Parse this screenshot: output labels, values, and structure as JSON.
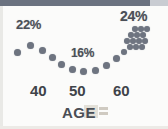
{
  "figure": {
    "top_bar_color": "#6b7280",
    "dot_color": "#6e7480",
    "text_color": "#4b4f57",
    "background_color": "#fbfbfa"
  },
  "axis": {
    "title": "AGE",
    "ticks": [
      {
        "label": "40",
        "x": 38
      },
      {
        "label": "50",
        "x": 77
      },
      {
        "label": "60",
        "x": 121
      }
    ]
  },
  "annotations": [
    {
      "name": "left-peak-label",
      "text": "22%"
    },
    {
      "name": "right-peak-label",
      "text": "24%"
    },
    {
      "name": "trough-label",
      "text": "16%"
    }
  ],
  "chart_data": {
    "type": "scatter",
    "title": "",
    "subtitle": "",
    "xlabel": "AGE",
    "ylabel": "",
    "xlim": [
      34,
      66
    ],
    "ylim": [
      14,
      26
    ],
    "grid": false,
    "legend": null,
    "tick_labels_x": [
      "40",
      "50",
      "60"
    ],
    "annotations": [
      "22%",
      "24%",
      "16%"
    ],
    "series": [
      {
        "name": "percent-by-age",
        "points": [
          {
            "x": 36.0,
            "y": 21.0
          },
          {
            "x": 38.5,
            "y": 21.6
          },
          {
            "x": 41.0,
            "y": 20.6
          },
          {
            "x": 43.5,
            "y": 19.6
          },
          {
            "x": 46.0,
            "y": 18.4
          },
          {
            "x": 48.0,
            "y": 17.2
          },
          {
            "x": 50.0,
            "y": 16.6
          },
          {
            "x": 52.0,
            "y": 16.4
          },
          {
            "x": 54.0,
            "y": 16.8
          },
          {
            "x": 56.0,
            "y": 17.8
          },
          {
            "x": 58.0,
            "y": 19.2
          },
          {
            "x": 59.5,
            "y": 20.4
          },
          {
            "x": 60.5,
            "y": 21.4
          },
          {
            "x": 61.5,
            "y": 22.2
          },
          {
            "x": 62.0,
            "y": 22.8
          },
          {
            "x": 62.5,
            "y": 23.4
          },
          {
            "x": 63.0,
            "y": 24.0
          },
          {
            "x": 63.5,
            "y": 24.4
          },
          {
            "x": 64.0,
            "y": 24.8
          }
        ]
      }
    ]
  },
  "dots": {
    "curve": [
      {
        "x": 17,
        "y": 46,
        "d": 7
      },
      {
        "x": 30,
        "y": 39,
        "d": 7
      },
      {
        "x": 42,
        "y": 44,
        "d": 7
      },
      {
        "x": 52,
        "y": 51,
        "d": 7
      },
      {
        "x": 61,
        "y": 58,
        "d": 7
      },
      {
        "x": 72,
        "y": 63,
        "d": 7
      },
      {
        "x": 83,
        "y": 65,
        "d": 7
      },
      {
        "x": 95,
        "y": 64,
        "d": 7
      },
      {
        "x": 106,
        "y": 59,
        "d": 7
      },
      {
        "x": 116,
        "y": 52,
        "d": 7
      }
    ],
    "cluster": [
      {
        "x": 124,
        "y": 46,
        "d": 6
      },
      {
        "x": 130,
        "y": 41,
        "d": 6
      },
      {
        "x": 136,
        "y": 41,
        "d": 6
      },
      {
        "x": 142,
        "y": 41,
        "d": 6
      },
      {
        "x": 127,
        "y": 35,
        "d": 6
      },
      {
        "x": 133,
        "y": 35,
        "d": 6
      },
      {
        "x": 139,
        "y": 35,
        "d": 6
      },
      {
        "x": 145,
        "y": 35,
        "d": 6
      },
      {
        "x": 131,
        "y": 29,
        "d": 6
      },
      {
        "x": 137,
        "y": 29,
        "d": 6
      },
      {
        "x": 143,
        "y": 29,
        "d": 6
      },
      {
        "x": 135,
        "y": 23,
        "d": 6
      },
      {
        "x": 141,
        "y": 23,
        "d": 6
      },
      {
        "x": 147,
        "y": 23,
        "d": 6
      }
    ]
  }
}
